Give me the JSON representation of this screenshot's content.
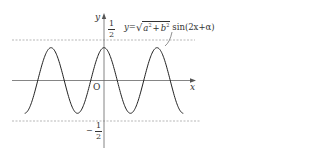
{
  "chart_data": {
    "type": "line",
    "title": "",
    "equation": "y=√(a²+b²) sin(2x+α)",
    "xlabel": "x",
    "ylabel": "y",
    "origin_label": "O",
    "y_tick_labels": {
      "upper": {
        "num": "1",
        "den": "2",
        "value": 0.5
      },
      "lower": {
        "sign": "−",
        "num": "1",
        "den": "2",
        "value": -0.5
      }
    },
    "reference_lines": [
      {
        "y": 0.5,
        "style": "dashed"
      },
      {
        "y": -0.5,
        "style": "dashed"
      }
    ],
    "series": [
      {
        "name": "y=√(a²+b²) sin(2x+α)",
        "function": "A·sin(2x+α)",
        "amplitude_approx": 0.41,
        "period": "π",
        "peaks_x_approx": [
          -3.14,
          0,
          3.14
        ],
        "troughs_x_approx": [
          -1.57,
          1.57
        ],
        "x_range_approx": [
          -4.7,
          4.7
        ]
      }
    ],
    "grid": false,
    "legend": "none (annotation with leader line)"
  },
  "labels": {
    "y_axis": "y",
    "x_axis": "x",
    "origin": "O",
    "eq_prefix": "y=",
    "eq_a": "a",
    "eq_plus": "+",
    "eq_b": "b",
    "eq_sup": "2",
    "eq_suffix": "sin(2x+α)",
    "half_num": "1",
    "half_den": "2",
    "neg_sign": "−"
  },
  "colors": {
    "axis": "#555555",
    "curve": "#222222",
    "dashed": "#888888",
    "text": "#333333"
  }
}
